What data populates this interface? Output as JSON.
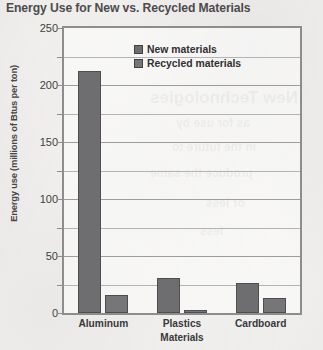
{
  "chart_data": {
    "type": "bar",
    "title": "Energy Use for New vs. Recycled Materials",
    "xlabel": "Materials",
    "ylabel": "Energy use (millions of Btus per ton)",
    "categories": [
      "Aluminum",
      "Plastics",
      "Cardboard"
    ],
    "series": [
      {
        "name": "New materials",
        "values": [
          212,
          31,
          26
        ],
        "color": "#6e6e70"
      },
      {
        "name": "Recycled materials",
        "values": [
          16,
          3,
          13
        ],
        "color": "#767678"
      }
    ],
    "ylim": [
      0,
      250
    ],
    "y_ticks_major": [
      0,
      50,
      100,
      150,
      200,
      250
    ],
    "y_ticks_minor": [
      25,
      75,
      125,
      175,
      225
    ],
    "y_tick_labels": [
      "0",
      "50",
      "100",
      "150",
      "200",
      "250"
    ],
    "grid": true,
    "legend_position": "top-center"
  },
  "legend": {
    "items": [
      {
        "label": "New materials",
        "swatch": "legend-swatch-new"
      },
      {
        "label": "Recycled materials",
        "swatch": "legend-swatch-recycled"
      }
    ]
  },
  "bleed_through": {
    "lines": [
      "New Technologies",
      "as for use by",
      "in the future to",
      "produce the same",
      "or less",
      "less"
    ]
  }
}
